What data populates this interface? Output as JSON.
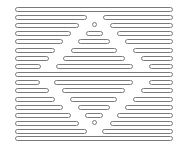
{
  "figure": {
    "stroke_color": "#7a7a7a",
    "fill_color": "#ffffff",
    "rows": [
      {
        "y": 7,
        "segments": [
          [
            15,
            173
          ]
        ]
      },
      {
        "y": 15,
        "segments": [
          [
            15,
            87
          ],
          [
            103,
            173
          ]
        ]
      },
      {
        "y": 23,
        "segments": [
          [
            15,
            79
          ],
          [
            110,
            173
          ]
        ],
        "dot": 94
      },
      {
        "y": 31,
        "segments": [
          [
            15,
            71
          ],
          [
            86,
            103
          ],
          [
            117,
            173
          ]
        ]
      },
      {
        "y": 39,
        "segments": [
          [
            15,
            63
          ],
          [
            78,
            110
          ],
          [
            125,
            173
          ]
        ]
      },
      {
        "y": 48,
        "segments": [
          [
            15,
            55
          ],
          [
            71,
            117
          ],
          [
            133,
            173
          ]
        ]
      },
      {
        "y": 56,
        "segments": [
          [
            15,
            49
          ],
          [
            63,
            125
          ],
          [
            141,
            173
          ]
        ]
      },
      {
        "y": 64,
        "segments": [
          [
            15,
            41
          ],
          [
            56,
            133
          ],
          [
            149,
            173
          ]
        ]
      },
      {
        "y": 72,
        "segments": [
          [
            15,
            173
          ]
        ]
      },
      {
        "y": 80,
        "segments": [
          [
            15,
            40
          ],
          [
            54,
            133
          ],
          [
            149,
            173
          ]
        ]
      },
      {
        "y": 88,
        "segments": [
          [
            15,
            49
          ],
          [
            62,
            125
          ],
          [
            141,
            173
          ]
        ]
      },
      {
        "y": 97,
        "segments": [
          [
            15,
            55
          ],
          [
            70,
            117
          ],
          [
            133,
            173
          ]
        ]
      },
      {
        "y": 105,
        "segments": [
          [
            15,
            63
          ],
          [
            78,
            110
          ],
          [
            125,
            173
          ]
        ]
      },
      {
        "y": 113,
        "segments": [
          [
            15,
            71
          ],
          [
            85,
            103
          ],
          [
            117,
            173
          ]
        ]
      },
      {
        "y": 121,
        "segments": [
          [
            15,
            79
          ],
          [
            110,
            173
          ]
        ],
        "dot": 94
      },
      {
        "y": 129,
        "segments": [
          [
            15,
            87
          ],
          [
            102,
            173
          ]
        ]
      },
      {
        "y": 136,
        "segments": [
          [
            15,
            173
          ]
        ]
      }
    ]
  }
}
